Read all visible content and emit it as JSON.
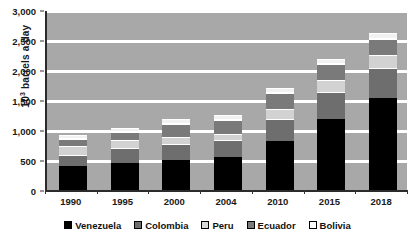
{
  "chart_data": {
    "type": "bar",
    "stacked": true,
    "title": "",
    "xlabel": "",
    "ylabel": "10³ barrels a day",
    "ylabel_base": "10",
    "ylabel_exp": "3",
    "ylabel_rest": " barrels a day",
    "categories": [
      "1990",
      "1995",
      "2000",
      "2004",
      "2010",
      "2015",
      "2018"
    ],
    "ylim": [
      0,
      3000
    ],
    "yticks": [
      0,
      500,
      1000,
      1500,
      2000,
      2500,
      3000
    ],
    "ytick_labels": [
      "0",
      "500",
      "1,000",
      "1,500",
      "2,000",
      "2,500",
      "3,000"
    ],
    "grid": true,
    "legend_position": "bottom",
    "series": [
      {
        "name": "Venezuela",
        "color": "#000000",
        "values": [
          420,
          460,
          510,
          570,
          840,
          1200,
          1550
        ]
      },
      {
        "name": "Colombia",
        "color": "#6e6e6e",
        "values": [
          170,
          240,
          260,
          260,
          350,
          440,
          480
        ]
      },
      {
        "name": "Peru",
        "color": "#d2d2d2",
        "values": [
          130,
          120,
          100,
          95,
          150,
          175,
          200
        ]
      },
      {
        "name": "Ecuador",
        "color": "#7a7a7a",
        "values": [
          90,
          110,
          200,
          210,
          245,
          245,
          250
        ]
      },
      {
        "name": "Bolivia",
        "color": "#f2f2f2",
        "values": [
          35,
          35,
          45,
          50,
          50,
          65,
          65
        ]
      }
    ],
    "totals": [
      845,
      965,
      1115,
      1185,
      1635,
      2125,
      2545
    ],
    "plot_background": "#a8a8a8",
    "gridline_color": "#ffffff",
    "axis_color": "#2b2b2b"
  }
}
